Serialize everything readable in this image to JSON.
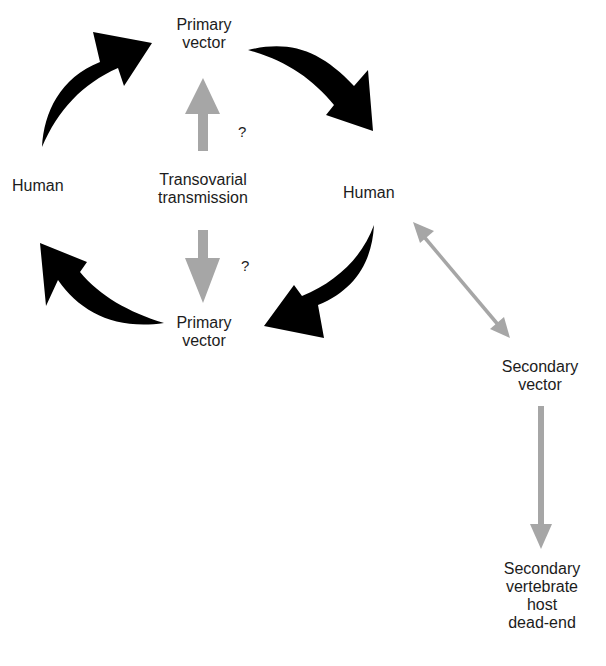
{
  "diagram": {
    "type": "transmission-cycle",
    "colors": {
      "primary_arrow": "#000000",
      "secondary_arrow": "#a6a6a6",
      "text": "#1c1c1c",
      "background": "#ffffff"
    },
    "nodes": {
      "primary_vector_top": {
        "line1": "Primary",
        "line2": "vector"
      },
      "human_left": {
        "label": "Human"
      },
      "transovarial": {
        "line1": "Transovarial",
        "line2": "transmission"
      },
      "human_right": {
        "label": "Human"
      },
      "primary_vector_bottom": {
        "line1": "Primary",
        "line2": "vector"
      },
      "secondary_vector": {
        "line1": "Secondary",
        "line2": "vector"
      },
      "secondary_host": {
        "line1": "Secondary",
        "line2": "vertebrate",
        "line3": "host",
        "line4": "dead-end"
      }
    },
    "uncertainty_marks": {
      "upper": "?",
      "lower": "?"
    },
    "edges": [
      {
        "from": "Human (left)",
        "to": "Primary vector (top)",
        "style": "black curved arrow"
      },
      {
        "from": "Primary vector (top)",
        "to": "Human (right)",
        "style": "black curved arrow"
      },
      {
        "from": "Human (right)",
        "to": "Primary vector (bottom)",
        "style": "black curved arrow"
      },
      {
        "from": "Primary vector (bottom)",
        "to": "Human (left)",
        "style": "black curved arrow"
      },
      {
        "from": "Transovarial transmission",
        "to": "Primary vector (top)",
        "style": "gray arrow",
        "note": "?"
      },
      {
        "from": "Transovarial transmission",
        "to": "Primary vector (bottom)",
        "style": "gray arrow",
        "note": "?"
      },
      {
        "from": "Human (right)",
        "to": "Secondary vector",
        "style": "gray double-headed arrow"
      },
      {
        "from": "Secondary vector",
        "to": "Secondary vertebrate host dead-end",
        "style": "gray arrow"
      }
    ]
  }
}
